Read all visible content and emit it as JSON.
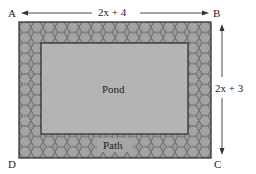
{
  "diagram": {
    "corners": {
      "a": "A",
      "b": "B",
      "c": "C",
      "d": "D"
    },
    "dimensions": {
      "width_label": "2x + 4",
      "height_label": "2x + 3"
    },
    "regions": {
      "inner": "Pond",
      "outer": "Path"
    },
    "colors": {
      "path_fill": "#9a9a9a",
      "hex_stroke": "#555555",
      "pond_fill": "#b4b4b4",
      "border": "#333333",
      "text": "#222222"
    }
  }
}
